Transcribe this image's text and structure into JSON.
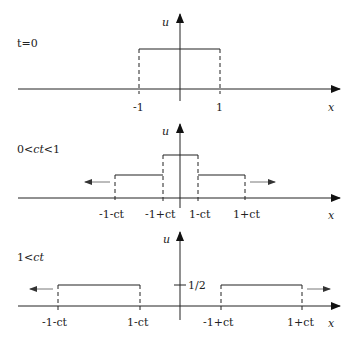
{
  "panels": [
    {
      "condition": "t=0",
      "axis_x_label": "x",
      "axis_u_label": "u",
      "ticks": [
        "-1",
        "1"
      ]
    },
    {
      "condition": "0<ct<1",
      "axis_x_label": "x",
      "axis_u_label": "u",
      "ticks": [
        "-1-ct",
        "-1+ct",
        "1-ct",
        "1+ct"
      ]
    },
    {
      "condition": "1<ct",
      "axis_x_label": "x",
      "axis_u_label": "u",
      "ticks": [
        "-1-ct",
        "1-ct",
        "-1+ct",
        "1+ct"
      ],
      "u_tick": "1/2"
    }
  ],
  "colors": {
    "line": "#222222",
    "arrow": "#444444"
  }
}
